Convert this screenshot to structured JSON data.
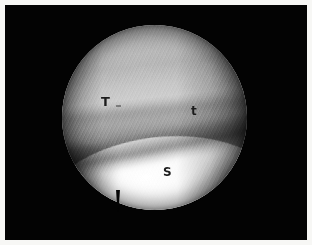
{
  "image": {
    "modality": "arthroscopy",
    "view": "circular-endoscopic-field",
    "border_color": "#f7f7f5",
    "background_color": "#030303",
    "alt": "Arthroscopic view with circular field of view showing three labelled structures"
  },
  "annotations": [
    {
      "id": "talus-major",
      "text": "T",
      "x": 96,
      "y": 90
    },
    {
      "id": "talus-minor",
      "text": "t",
      "x": 186,
      "y": 100
    },
    {
      "id": "sulcus",
      "text": "S",
      "x": 158,
      "y": 161
    }
  ],
  "field_of_view": {
    "shape": "circle",
    "center_x": 154,
    "center_y": 117,
    "radius": 92,
    "notch": "bottom-center"
  },
  "tissue": {
    "upper_label": "T",
    "upper_secondary_label": "t",
    "lower_label": "S",
    "upper_tone": "#9a9a9a",
    "lower_tone": "#f4f4f4",
    "groove_tone": "#3a3a3a"
  }
}
